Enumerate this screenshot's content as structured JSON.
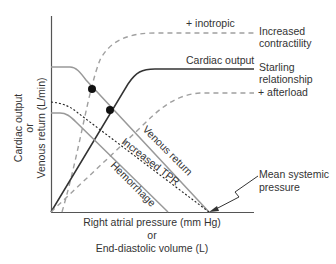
{
  "diagram": {
    "type": "cardiac-output-venous-return-curves",
    "y_axis": {
      "line1": "Cardiac output",
      "line2": "or",
      "line3": "Venous return (L/min)"
    },
    "x_axis": {
      "line1": "Right atrial pressure (mm Hg)",
      "line2": "or",
      "line3": "End-diastolic volume (L)"
    },
    "curves": {
      "inotropic": {
        "label": "+ inotropic",
        "style": "dashed",
        "color": "#999999"
      },
      "cardiac_output": {
        "label": "Cardiac output",
        "style": "solid",
        "color": "#333333"
      },
      "afterload": {
        "label": "+ afterload",
        "style": "dashed",
        "color": "#999999"
      },
      "venous_return": {
        "label": "Venous return",
        "style": "solid",
        "color": "#999999"
      },
      "increased_tpr": {
        "label": "Increased TPR",
        "style": "dotted",
        "color": "#222222"
      },
      "hemorrhage": {
        "label": "Hemorrhage",
        "style": "solid",
        "color": "#999999"
      }
    },
    "side_labels": {
      "increased_contractility_1": "Increased",
      "increased_contractility_2": "contractility",
      "starling_1": "Starling",
      "starling_2": "relationship"
    },
    "annotation": {
      "line1": "Mean systemic",
      "line2": "pressure"
    },
    "intersection_points": [
      {
        "name": "inotropic-venous-return",
        "x": 92,
        "y": 89
      },
      {
        "name": "cardiac-output-venous-return",
        "x": 110,
        "y": 110
      }
    ]
  }
}
